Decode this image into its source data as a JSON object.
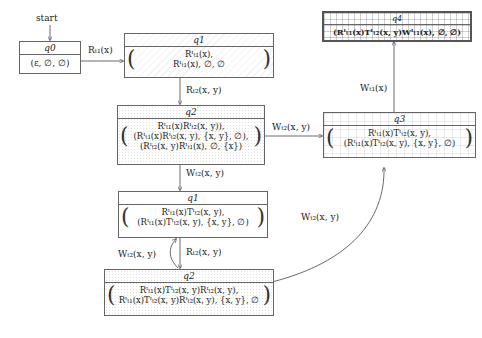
{
  "start_label": "start",
  "states": {
    "q0": {
      "name": "q0",
      "lines": [
        "(ε, ∅, ∅)"
      ],
      "pattern": "plain"
    },
    "q1_top": {
      "name": "q1",
      "lines": [
        "R^I_{t1}(x),",
        "R^I_{t1}(x), ∅, ∅"
      ],
      "display": [
        "Rᴵₜ₁(x),",
        "Rᴵₜ₁(x), ∅, ∅"
      ],
      "pattern": "hatch"
    },
    "q2_top": {
      "name": "q2",
      "display": [
        "Rᴵₜ₁(x)Rᴵₜ₂(x, y)),",
        "(Rᴵₜ₁(x)Rᴵₜ₂(x, y), {x, y}, ∅),",
        "(Rᴵₜ₂(x, y)Rᴵₜ₁(x), ∅, {x})"
      ],
      "pattern": "dots"
    },
    "q3": {
      "name": "q3",
      "display": [
        "Rᴵₜ₁(x)Tᴵₜ₂(x, y),",
        "(Rᴵₜ₁(x)Tᴵₜ₂(x, y), {x, y}, ∅)"
      ],
      "pattern": "finegrid"
    },
    "q4": {
      "name": "q4",
      "display": [
        "(Rᴵₜ₁(x)Tᴵₜ₂(x, y)Wᴵₜ₁(x), ∅, ∅)"
      ],
      "pattern": "grid",
      "accepting": true
    },
    "q1_mid": {
      "name": "q1",
      "display": [
        "Rᴵₜ₁(x)Tᴵₜ₂(x, y),",
        "(Rᴵₜ₁(x)Tᴵₜ₂(x, y), {x, y}, ∅)"
      ],
      "pattern": "plain"
    },
    "q2_bot": {
      "name": "q2",
      "display": [
        "Rᴵₜ₁(x)Tᴵₜ₂(x, y)Rᴵₜ₂(x, y),",
        "Rᴵₜ₁(x)Tᴵₜ₂(x, y)Rᴵₜ₂(x, y), {x, y}, ∅"
      ],
      "pattern": "dots"
    }
  },
  "edges": [
    {
      "from": "q0",
      "to": "q1_top",
      "label": "Rₜ₁(x)"
    },
    {
      "from": "q1_top",
      "to": "q2_top",
      "label": "Rₜ₂(x, y)"
    },
    {
      "from": "q2_top",
      "to": "q3",
      "label": "Wₜ₂(x, y)"
    },
    {
      "from": "q2_top",
      "to": "q1_mid",
      "label": "Wₜ₂(x, y)"
    },
    {
      "from": "q3",
      "to": "q4",
      "label": "Wₜ₁(x)"
    },
    {
      "from": "q1_mid",
      "to": "q2_bot",
      "label": "Rₜ₂(x, y)"
    },
    {
      "from": "q2_bot",
      "to": "q1_mid",
      "label": "Wₜ₂(x, y)"
    },
    {
      "from": "q2_bot",
      "to": "q3",
      "label": "Wₜ₂(x, y)"
    }
  ]
}
